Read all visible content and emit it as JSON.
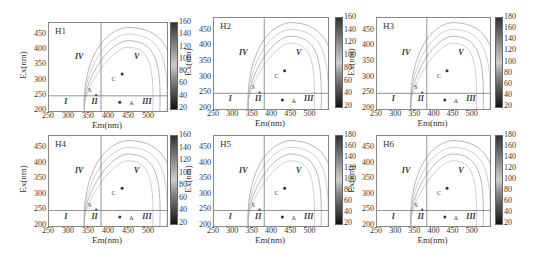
{
  "chart_data": [
    {
      "type": "heatmap",
      "subtype": "EEM fluorescence contour",
      "title": "H1",
      "xlabel": "Em(nm)",
      "ylabel": "Ex(nm)",
      "xticks": [
        250,
        300,
        350,
        400,
        450,
        500
      ],
      "yticks": [
        200,
        250,
        300,
        350,
        400,
        450
      ],
      "xlim": [
        250,
        545
      ],
      "ylim": [
        200,
        490
      ],
      "colorbar": {
        "min": 20,
        "max": 160,
        "ticks": [
          20,
          40,
          60,
          80,
          100,
          120,
          140,
          160
        ]
      },
      "divider_lines": {
        "em": 380,
        "ex": 250
      },
      "regions": [
        "I",
        "II",
        "III",
        "IV",
        "V"
      ],
      "peaks": [
        "S",
        "C",
        "A"
      ]
    },
    {
      "type": "heatmap",
      "subtype": "EEM fluorescence contour",
      "title": "H2",
      "xlabel": "Em(nm)",
      "ylabel": "Ex(nm)",
      "xticks": [
        250,
        300,
        350,
        400,
        450,
        500
      ],
      "yticks": [
        200,
        250,
        300,
        350,
        400,
        450
      ],
      "xlim": [
        250,
        545
      ],
      "ylim": [
        200,
        490
      ],
      "colorbar": {
        "min": 20,
        "max": 160,
        "ticks": [
          20,
          40,
          60,
          80,
          100,
          120,
          140,
          160
        ]
      },
      "divider_lines": {
        "em": 380,
        "ex": 250
      },
      "regions": [
        "I",
        "II",
        "III",
        "IV",
        "V"
      ],
      "peaks": [
        "S",
        "C",
        "A"
      ]
    },
    {
      "type": "heatmap",
      "subtype": "EEM fluorescence contour",
      "title": "H3",
      "xlabel": "Em(nm)",
      "ylabel": "Ex(nm)",
      "xticks": [
        250,
        300,
        350,
        400,
        450,
        500
      ],
      "yticks": [
        200,
        250,
        300,
        350,
        400,
        450
      ],
      "xlim": [
        250,
        545
      ],
      "ylim": [
        200,
        490
      ],
      "colorbar": {
        "min": 20,
        "max": 180,
        "ticks": [
          20,
          40,
          60,
          80,
          100,
          120,
          140,
          160,
          180
        ]
      },
      "divider_lines": {
        "em": 380,
        "ex": 250
      },
      "regions": [
        "I",
        "II",
        "III",
        "IV",
        "V"
      ],
      "peaks": [
        "S",
        "C",
        "A"
      ]
    },
    {
      "type": "heatmap",
      "subtype": "EEM fluorescence contour",
      "title": "H4",
      "xlabel": "Em(nm)",
      "ylabel": "Ex(nm)",
      "xticks": [
        250,
        300,
        350,
        400,
        450,
        500
      ],
      "yticks": [
        200,
        250,
        300,
        350,
        400,
        450
      ],
      "xlim": [
        250,
        545
      ],
      "ylim": [
        200,
        490
      ],
      "colorbar": {
        "min": 20,
        "max": 160,
        "ticks": [
          20,
          40,
          60,
          80,
          100,
          120,
          140,
          160
        ]
      },
      "divider_lines": {
        "em": 380,
        "ex": 250
      },
      "regions": [
        "I",
        "II",
        "III",
        "IV",
        "V"
      ],
      "peaks": [
        "S",
        "C",
        "A"
      ]
    },
    {
      "type": "heatmap",
      "subtype": "EEM fluorescence contour",
      "title": "H5",
      "xlabel": "Em(nm)",
      "ylabel": "Ex(nm)",
      "xticks": [
        250,
        300,
        350,
        400,
        450,
        500
      ],
      "yticks": [
        200,
        250,
        300,
        350,
        400,
        450
      ],
      "xlim": [
        250,
        545
      ],
      "ylim": [
        200,
        490
      ],
      "colorbar": {
        "min": 20,
        "max": 180,
        "ticks": [
          20,
          40,
          60,
          80,
          100,
          120,
          140,
          160,
          180
        ]
      },
      "divider_lines": {
        "em": 380,
        "ex": 250
      },
      "regions": [
        "I",
        "II",
        "III",
        "IV",
        "V"
      ],
      "peaks": [
        "S",
        "C",
        "A"
      ]
    },
    {
      "type": "heatmap",
      "subtype": "EEM fluorescence contour",
      "title": "H6",
      "xlabel": "Em(nm)",
      "ylabel": "Ex(nm)",
      "xticks": [
        250,
        300,
        350,
        400,
        450,
        500
      ],
      "yticks": [
        200,
        250,
        300,
        350,
        400,
        450
      ],
      "xlim": [
        250,
        545
      ],
      "ylim": [
        200,
        490
      ],
      "colorbar": {
        "min": 20,
        "max": 180,
        "ticks": [
          20,
          40,
          60,
          80,
          100,
          120,
          140,
          160,
          180
        ]
      },
      "divider_lines": {
        "em": 380,
        "ex": 250
      },
      "regions": [
        "I",
        "II",
        "III",
        "IV",
        "V"
      ],
      "peaks": [
        "S",
        "C",
        "A"
      ]
    }
  ],
  "panels": [
    {
      "title": "H1",
      "cticks": [
        "160",
        "140",
        "120",
        "100",
        "80",
        "60",
        "40",
        "20"
      ]
    },
    {
      "title": "H2",
      "cticks": [
        "160",
        "140",
        "120",
        "100",
        "80",
        "60",
        "40",
        "20"
      ]
    },
    {
      "title": "H3",
      "cticks": [
        "180",
        "160",
        "140",
        "120",
        "100",
        "80",
        "60",
        "40",
        "20"
      ]
    },
    {
      "title": "H4",
      "cticks": [
        "160",
        "140",
        "120",
        "100",
        "80",
        "60",
        "40",
        "20"
      ]
    },
    {
      "title": "H5",
      "cticks": [
        "180",
        "160",
        "140",
        "120",
        "100",
        "80",
        "60",
        "40",
        "20"
      ]
    },
    {
      "title": "H6",
      "cticks": [
        "180",
        "160",
        "140",
        "120",
        "100",
        "80",
        "60",
        "40",
        "20"
      ]
    }
  ],
  "axis": {
    "xlabel": "Em(nm)",
    "ylabel": "Ex(nm)",
    "xticks": [
      "250",
      "300",
      "350",
      "400",
      "450",
      "500"
    ],
    "yticks": [
      "450",
      "400",
      "350",
      "300",
      "250",
      "200"
    ]
  },
  "regions": {
    "r1": "I",
    "r2": "II",
    "r3": "III",
    "r4": "IV",
    "r5": "V"
  },
  "peaks": {
    "s": "S",
    "c": "C",
    "a": "A"
  }
}
